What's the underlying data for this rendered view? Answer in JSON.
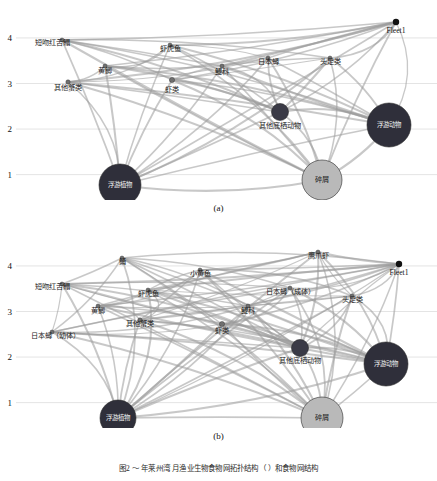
{
  "figure": {
    "caption": "图2  ～  年莱州湾  月渔业生物食物网拓扑结构（  ）和食物网结构",
    "panels": [
      {
        "id": "a",
        "caption": "(a)",
        "axis": {
          "label": "",
          "ticks": [
            "4",
            "3",
            "2",
            "1"
          ],
          "tick_values": [
            4,
            3,
            2,
            1
          ],
          "range": [
            0.75,
            4.35
          ]
        },
        "fleet": {
          "label": "Fleet1",
          "x": 396,
          "y": 22,
          "radius": 3.2,
          "color": "#111111"
        },
        "nodes": [
          {
            "name": "浮游植物",
            "x": 120,
            "y": 185,
            "tl": 1.0,
            "r": 21,
            "color": "#2f2f3a",
            "inside": true
          },
          {
            "name": "碎屑",
            "x": 322,
            "y": 180,
            "tl": 1.0,
            "r": 20,
            "color": "#b9b9b9",
            "inside": true,
            "dark_text": true
          },
          {
            "name": "浮游动物",
            "x": 389,
            "y": 125,
            "tl": 2.1,
            "r": 22,
            "color": "#2f2f3a",
            "inside": true
          },
          {
            "name": "其他底栖动物",
            "x": 280,
            "y": 112,
            "tl": 2.4,
            "r": 8.5,
            "color": "#3a3a46",
            "inside": false,
            "lx": 280,
            "ly": 128
          },
          {
            "name": "其他蟹类",
            "x": 68,
            "y": 82,
            "tl": 3.0,
            "r": 2.2,
            "color": "#6f6f6f",
            "inside": false,
            "lx": 68,
            "ly": 90
          },
          {
            "name": "虾类",
            "x": 172,
            "y": 80,
            "tl": 3.02,
            "r": 2.6,
            "color": "#6f6f6f",
            "inside": false,
            "lx": 172,
            "ly": 92
          },
          {
            "name": "黄鲫",
            "x": 105,
            "y": 66,
            "tl": 3.25,
            "r": 2.0,
            "color": "#6f6f6f",
            "inside": false,
            "lx": 105,
            "ly": 73
          },
          {
            "name": "鳀科",
            "x": 222,
            "y": 66,
            "tl": 3.25,
            "r": 2.0,
            "color": "#6f6f6f",
            "inside": false,
            "lx": 222,
            "ly": 74
          },
          {
            "name": "日本蟳",
            "x": 268,
            "y": 58,
            "tl": 3.4,
            "r": 2.0,
            "color": "#6f6f6f",
            "inside": false,
            "lx": 268,
            "ly": 64
          },
          {
            "name": "头足类",
            "x": 330,
            "y": 58,
            "tl": 3.4,
            "r": 2.0,
            "color": "#6f6f6f",
            "inside": false,
            "lx": 330,
            "ly": 64
          },
          {
            "name": "虾虎鱼",
            "x": 170,
            "y": 45,
            "tl": 3.65,
            "r": 2.0,
            "color": "#6f6f6f",
            "inside": false,
            "lx": 170,
            "ly": 51
          },
          {
            "name": "短吻红舌鳎",
            "x": 62,
            "y": 40,
            "tl": 3.78,
            "r": 2.0,
            "color": "#6f6f6f",
            "inside": false,
            "lx": 52,
            "ly": 45
          }
        ]
      },
      {
        "id": "b",
        "caption": "(b)",
        "axis": {
          "label": "",
          "ticks": [
            "4",
            "3",
            "2",
            "1"
          ],
          "tick_values": [
            4,
            3,
            2,
            1
          ],
          "range": [
            0.75,
            4.35
          ]
        },
        "fleet": {
          "label": "Fleet1",
          "x": 399,
          "y": 36,
          "radius": 3.2,
          "color": "#111111"
        },
        "nodes": [
          {
            "name": "浮游植物",
            "x": 118,
            "y": 190,
            "tl": 1.0,
            "r": 18,
            "color": "#2f2f3a",
            "inside": true
          },
          {
            "name": "碎屑",
            "x": 322,
            "y": 190,
            "tl": 1.0,
            "r": 21,
            "color": "#b9b9b9",
            "inside": true,
            "dark_text": true
          },
          {
            "name": "浮游动物",
            "x": 386,
            "y": 136,
            "tl": 2.15,
            "r": 22,
            "color": "#2f2f3a",
            "inside": true
          },
          {
            "name": "其他底栖动物",
            "x": 300,
            "y": 120,
            "tl": 2.45,
            "r": 8.5,
            "color": "#3a3a46",
            "inside": false,
            "lx": 300,
            "ly": 135
          },
          {
            "name": "日本蟳（幼体）",
            "x": 52,
            "y": 104,
            "tl": 2.85,
            "r": 2.0,
            "color": "#6f6f6f",
            "inside": false,
            "lx": 55,
            "ly": 110
          },
          {
            "name": "其他蟹类",
            "x": 140,
            "y": 92,
            "tl": 3.0,
            "r": 2.2,
            "color": "#6f6f6f",
            "inside": false,
            "lx": 140,
            "ly": 98
          },
          {
            "name": "虾类",
            "x": 222,
            "y": 96,
            "tl": 3.0,
            "r": 2.6,
            "color": "#6f6f6f",
            "inside": false,
            "lx": 222,
            "ly": 105
          },
          {
            "name": "黄鲫",
            "x": 98,
            "y": 78,
            "tl": 3.2,
            "r": 2.0,
            "color": "#6f6f6f",
            "inside": false,
            "lx": 98,
            "ly": 85
          },
          {
            "name": "鳀科",
            "x": 248,
            "y": 78,
            "tl": 3.2,
            "r": 2.0,
            "color": "#6f6f6f",
            "inside": false,
            "lx": 248,
            "ly": 85
          },
          {
            "name": "虾虎鱼",
            "x": 148,
            "y": 62,
            "tl": 3.45,
            "r": 2.0,
            "color": "#6f6f6f",
            "inside": false,
            "lx": 148,
            "ly": 68
          },
          {
            "name": "日本蟳（成体）",
            "x": 290,
            "y": 60,
            "tl": 3.5,
            "r": 2.0,
            "color": "#6f6f6f",
            "inside": false,
            "lx": 290,
            "ly": 66
          },
          {
            "name": "头足类",
            "x": 352,
            "y": 68,
            "tl": 3.35,
            "r": 2.0,
            "color": "#6f6f6f",
            "inside": false,
            "lx": 352,
            "ly": 74
          },
          {
            "name": "短吻红舌鳎",
            "x": 62,
            "y": 56,
            "tl": 3.6,
            "r": 2.0,
            "color": "#6f6f6f",
            "inside": false,
            "lx": 52,
            "ly": 61
          },
          {
            "name": "小黄鱼",
            "x": 200,
            "y": 42,
            "tl": 3.85,
            "r": 2.0,
            "color": "#6f6f6f",
            "inside": false,
            "lx": 200,
            "ly": 48
          },
          {
            "name": "鲬",
            "x": 122,
            "y": 30,
            "tl": 4.05,
            "r": 2.0,
            "color": "#6f6f6f",
            "inside": false,
            "lx": 122,
            "ly": 36
          },
          {
            "name": "鹰爪虾",
            "x": 318,
            "y": 24,
            "tl": 4.15,
            "r": 2.0,
            "color": "#6f6f6f",
            "inside": false,
            "lx": 318,
            "ly": 30
          }
        ]
      }
    ]
  },
  "chart_data": {
    "type": "scatter",
    "title": "",
    "xlabel": "",
    "ylabel": "营养级 Trophic level",
    "ylim": [
      0.75,
      4.35
    ],
    "yticks": [
      1,
      2,
      3,
      4
    ],
    "grid": true,
    "legend": "none",
    "series": [
      {
        "name": "(a) 食物网拓扑结构",
        "points": [
          {
            "label": "浮游植物",
            "trophic_level": 1.0,
            "size": "large",
            "color": "#2f2f3a"
          },
          {
            "label": "碎屑",
            "trophic_level": 1.0,
            "size": "large",
            "color": "#b9b9b9"
          },
          {
            "label": "浮游动物",
            "trophic_level": 2.1,
            "size": "large",
            "color": "#2f2f3a"
          },
          {
            "label": "其他底栖动物",
            "trophic_level": 2.4,
            "size": "medium",
            "color": "#3a3a46"
          },
          {
            "label": "其他蟹类",
            "trophic_level": 3.0,
            "size": "small",
            "color": "#6f6f6f"
          },
          {
            "label": "虾类",
            "trophic_level": 3.0,
            "size": "small",
            "color": "#6f6f6f"
          },
          {
            "label": "黄鲫",
            "trophic_level": 3.25,
            "size": "small",
            "color": "#6f6f6f"
          },
          {
            "label": "鳀科",
            "trophic_level": 3.25,
            "size": "small",
            "color": "#6f6f6f"
          },
          {
            "label": "日本蟳",
            "trophic_level": 3.4,
            "size": "small",
            "color": "#6f6f6f"
          },
          {
            "label": "头足类",
            "trophic_level": 3.4,
            "size": "small",
            "color": "#6f6f6f"
          },
          {
            "label": "虾虎鱼",
            "trophic_level": 3.65,
            "size": "small",
            "color": "#6f6f6f"
          },
          {
            "label": "短吻红舌鳎",
            "trophic_level": 3.8,
            "size": "small",
            "color": "#6f6f6f"
          },
          {
            "label": "Fleet1",
            "trophic_level": 4.0,
            "size": "tiny",
            "color": "#111111"
          }
        ]
      },
      {
        "name": "(b) 食物网结构",
        "points": [
          {
            "label": "浮游植物",
            "trophic_level": 1.0,
            "size": "large",
            "color": "#2f2f3a"
          },
          {
            "label": "碎屑",
            "trophic_level": 1.0,
            "size": "large",
            "color": "#b9b9b9"
          },
          {
            "label": "浮游动物",
            "trophic_level": 2.15,
            "size": "large",
            "color": "#2f2f3a"
          },
          {
            "label": "其他底栖动物",
            "trophic_level": 2.45,
            "size": "medium",
            "color": "#3a3a46"
          },
          {
            "label": "日本蟳（幼体）",
            "trophic_level": 2.85,
            "size": "small",
            "color": "#6f6f6f"
          },
          {
            "label": "其他蟹类",
            "trophic_level": 3.0,
            "size": "small",
            "color": "#6f6f6f"
          },
          {
            "label": "虾类",
            "trophic_level": 3.0,
            "size": "small",
            "color": "#6f6f6f"
          },
          {
            "label": "黄鲫",
            "trophic_level": 3.2,
            "size": "small",
            "color": "#6f6f6f"
          },
          {
            "label": "鳀科",
            "trophic_level": 3.2,
            "size": "small",
            "color": "#6f6f6f"
          },
          {
            "label": "头足类",
            "trophic_level": 3.35,
            "size": "small",
            "color": "#6f6f6f"
          },
          {
            "label": "虾虎鱼",
            "trophic_level": 3.45,
            "size": "small",
            "color": "#6f6f6f"
          },
          {
            "label": "日本蟳（成体）",
            "trophic_level": 3.5,
            "size": "small",
            "color": "#6f6f6f"
          },
          {
            "label": "短吻红舌鳎",
            "trophic_level": 3.6,
            "size": "small",
            "color": "#6f6f6f"
          },
          {
            "label": "小黄鱼",
            "trophic_level": 3.85,
            "size": "small",
            "color": "#6f6f6f"
          },
          {
            "label": "鲬",
            "trophic_level": 4.05,
            "size": "small",
            "color": "#6f6f6f"
          },
          {
            "label": "鹰爪虾",
            "trophic_level": 4.15,
            "size": "small",
            "color": "#6f6f6f"
          },
          {
            "label": "Fleet1",
            "trophic_level": 3.9,
            "size": "tiny",
            "color": "#111111"
          }
        ]
      }
    ]
  }
}
